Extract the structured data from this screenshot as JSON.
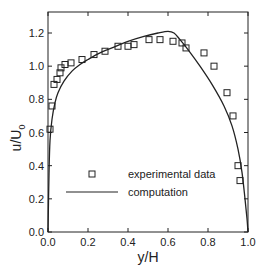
{
  "chart_data": {
    "type": "scatter",
    "title": "",
    "xlabel": "y/H",
    "ylabel": "u/U0",
    "xlim": [
      0.0,
      1.0
    ],
    "ylim": [
      0.0,
      1.3
    ],
    "xticks": [
      "0.0",
      "0.2",
      "0.4",
      "0.6",
      "0.8",
      "1.0"
    ],
    "yticks": [
      "0.0",
      "0.2",
      "0.4",
      "0.6",
      "0.8",
      "1.0",
      "1.2"
    ],
    "grid": false,
    "legend_position": "lower-center-inside",
    "series": [
      {
        "name": "experimental data",
        "type": "scatter",
        "marker": "open-square",
        "x": [
          0.01,
          0.02,
          0.03,
          0.045,
          0.06,
          0.065,
          0.085,
          0.115,
          0.17,
          0.23,
          0.285,
          0.35,
          0.4,
          0.43,
          0.505,
          0.56,
          0.625,
          0.67,
          0.69,
          0.78,
          0.83,
          0.895,
          0.925,
          0.95,
          0.96
        ],
        "y": [
          0.62,
          0.76,
          0.89,
          0.92,
          0.96,
          0.99,
          1.01,
          1.02,
          1.04,
          1.07,
          1.09,
          1.12,
          1.12,
          1.13,
          1.16,
          1.16,
          1.15,
          1.14,
          1.11,
          1.08,
          1.0,
          0.84,
          0.7,
          0.4,
          0.31
        ]
      },
      {
        "name": "computation",
        "type": "line",
        "x": [
          0.0,
          0.005,
          0.01,
          0.02,
          0.035,
          0.05,
          0.08,
          0.12,
          0.16,
          0.2,
          0.26,
          0.32,
          0.4,
          0.48,
          0.55,
          0.6,
          0.63,
          0.66,
          0.7,
          0.76,
          0.82,
          0.88,
          0.92,
          0.95,
          0.97,
          0.985,
          0.995,
          1.0
        ],
        "y": [
          0.0,
          0.35,
          0.55,
          0.68,
          0.78,
          0.84,
          0.91,
          0.97,
          1.01,
          1.04,
          1.08,
          1.11,
          1.15,
          1.18,
          1.2,
          1.21,
          1.2,
          1.16,
          1.1,
          1.0,
          0.89,
          0.76,
          0.64,
          0.5,
          0.36,
          0.2,
          0.08,
          0.0
        ]
      }
    ]
  },
  "legend": {
    "items": [
      {
        "label": "experimental data",
        "symbol": "open-square"
      },
      {
        "label": "computation",
        "symbol": "line"
      }
    ]
  },
  "axes": {
    "xlabel": "y/H",
    "ylabel_main": "u/U",
    "ylabel_sub": "0"
  },
  "colors": {
    "ink": "#222222",
    "background": "#ffffff"
  }
}
